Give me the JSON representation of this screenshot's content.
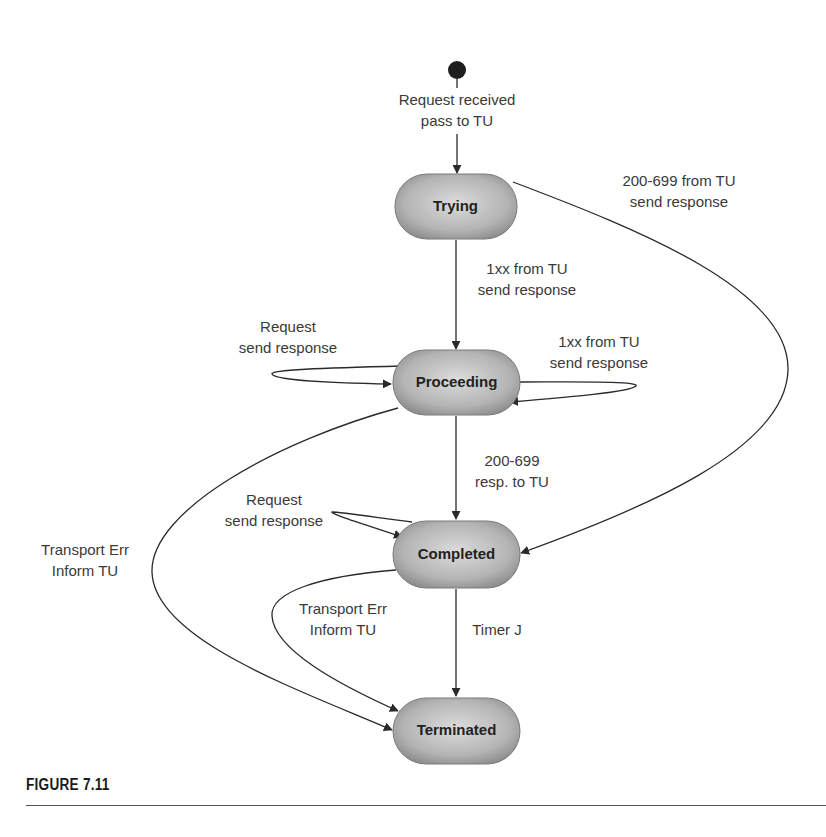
{
  "figure": {
    "caption": "FIGURE 7.11",
    "type": "state-machine"
  },
  "colors": {
    "node_fill_center": "#d4d4d4",
    "node_fill_edge": "#9a9a9a",
    "edge": "#2a2a2a",
    "text": "#3a3a3a"
  },
  "states": [
    {
      "id": "trying",
      "label": "Trying"
    },
    {
      "id": "proceeding",
      "label": "Proceeding"
    },
    {
      "id": "completed",
      "label": "Completed"
    },
    {
      "id": "terminated",
      "label": "Terminated"
    }
  ],
  "transitions": [
    {
      "from": "start",
      "to": "trying",
      "label": "Request received\npass to TU"
    },
    {
      "from": "trying",
      "to": "completed",
      "label": "200-699 from TU\nsend response"
    },
    {
      "from": "trying",
      "to": "proceeding",
      "label": "1xx from TU\nsend response"
    },
    {
      "from": "proceeding",
      "to": "proceeding",
      "label": "Request\nsend response"
    },
    {
      "from": "proceeding",
      "to": "proceeding",
      "label": "1xx from TU\nsend response"
    },
    {
      "from": "proceeding",
      "to": "completed",
      "label": "200-699\nresp. to TU"
    },
    {
      "from": "completed",
      "to": "completed",
      "label": "Request\nsend response"
    },
    {
      "from": "proceeding",
      "to": "terminated",
      "label": "Transport Err\nInform TU"
    },
    {
      "from": "completed",
      "to": "terminated",
      "label": "Transport Err\nInform TU"
    },
    {
      "from": "completed",
      "to": "terminated",
      "label": "Timer J"
    }
  ]
}
